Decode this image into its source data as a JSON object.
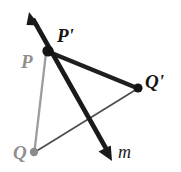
{
  "figure": {
    "background_color": "#ffffff",
    "width": 181,
    "height": 172,
    "labels": {
      "P": "P",
      "P_prime": "P'",
      "Q": "Q",
      "Q_prime": "Q'",
      "line_m": "m"
    },
    "colors": {
      "preimage_gray": "#999999",
      "image_black": "#1a1a1a",
      "thin_connector": "#4d4d4d",
      "label_gray": "#8f8f8f",
      "label_black": "#141414"
    },
    "points": [
      {
        "name": "P",
        "label": "P",
        "x": 46,
        "y": 52,
        "color": "#8f8f8f",
        "role": "preimage-vertex",
        "dot": false
      },
      {
        "name": "P'",
        "label": "P'",
        "x": 48,
        "y": 51,
        "color": "#141414",
        "role": "image-vertex",
        "dot": true
      },
      {
        "name": "Q",
        "label": "Q",
        "x": 34,
        "y": 152,
        "color": "#8f8f8f",
        "role": "preimage-vertex",
        "dot": true
      },
      {
        "name": "Q'",
        "label": "Q'",
        "x": 138,
        "y": 88,
        "color": "#141414",
        "role": "image-vertex",
        "dot": true
      }
    ],
    "segments": [
      {
        "name": "segment-P-Q",
        "from": "P",
        "to": "Q",
        "color": "#9d9d9d",
        "width": 2.2,
        "style": "solid"
      },
      {
        "name": "segment-Pprime-Qprime",
        "from": "P'",
        "to": "Q'",
        "color": "#1f1f1f",
        "width": 4.2,
        "style": "solid"
      },
      {
        "name": "segment-Q-Qprime",
        "from": "Q",
        "to": "Q'",
        "color": "#4d4d4d",
        "width": 1.6,
        "style": "solid"
      }
    ],
    "line_m": {
      "name": "line-m",
      "label": "m",
      "color": "#1a1a1a",
      "width": 4.6,
      "arrow_start": {
        "x": 29,
        "y": 12
      },
      "arrow_end": {
        "x": 112,
        "y": 160
      },
      "double_headed": true
    }
  }
}
